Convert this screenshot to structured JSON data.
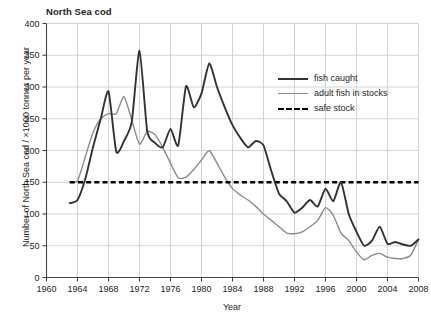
{
  "chart_data": {
    "type": "line",
    "title": "North Sea cod",
    "xlabel": "Year",
    "ylabel": "Number of North Sea cod / ×1000 tonnes per year",
    "xlim": [
      1960,
      2008
    ],
    "ylim": [
      0,
      400
    ],
    "xticks": [
      1960,
      1964,
      1968,
      1972,
      1976,
      1980,
      1984,
      1988,
      1992,
      1996,
      2000,
      2004,
      2008
    ],
    "yticks": [
      0,
      50,
      100,
      150,
      200,
      250,
      300,
      350,
      400
    ],
    "grid": true,
    "legend_position": "upper-right-inside",
    "colors": {
      "fish_caught": "#333333",
      "adult_fish_in_stocks": "#8b8b8b",
      "safe_stock": "#000000",
      "grid": "#c9c9c9",
      "axis": "#444444",
      "text": "#231f20",
      "background": "#ffffff"
    },
    "series": [
      {
        "name": "fish caught",
        "style": "solid",
        "color": "#333333",
        "x": [
          1963,
          1964,
          1965,
          1966,
          1967,
          1968,
          1969,
          1970,
          1971,
          1972,
          1973,
          1974,
          1975,
          1976,
          1977,
          1978,
          1979,
          1980,
          1981,
          1982,
          1983,
          1984,
          1985,
          1986,
          1987,
          1988,
          1989,
          1990,
          1991,
          1992,
          1993,
          1994,
          1995,
          1996,
          1997,
          1998,
          1999,
          2000,
          2001,
          2002,
          2003,
          2004,
          2005,
          2006,
          2007,
          2008
        ],
        "values": [
          117,
          122,
          155,
          205,
          250,
          293,
          198,
          215,
          245,
          357,
          230,
          212,
          205,
          234,
          208,
          301,
          268,
          290,
          337,
          300,
          268,
          240,
          220,
          205,
          215,
          208,
          168,
          132,
          120,
          102,
          110,
          122,
          112,
          140,
          120,
          150,
          100,
          72,
          50,
          58,
          80,
          53,
          56,
          52,
          50,
          60
        ]
      },
      {
        "name": "adult fish in stocks",
        "style": "solid",
        "color": "#8b8b8b",
        "x": [
          1963,
          1964,
          1965,
          1966,
          1967,
          1968,
          1969,
          1970,
          1971,
          1972,
          1973,
          1974,
          1975,
          1976,
          1977,
          1978,
          1979,
          1980,
          1981,
          1982,
          1983,
          1984,
          1985,
          1986,
          1987,
          1988,
          1989,
          1990,
          1991,
          1992,
          1993,
          1994,
          1995,
          1996,
          1997,
          1998,
          1999,
          2000,
          2001,
          2002,
          2003,
          2004,
          2005,
          2006,
          2007,
          2008
        ],
        "values": [
          150,
          152,
          190,
          228,
          250,
          258,
          258,
          285,
          248,
          210,
          230,
          225,
          205,
          180,
          157,
          158,
          170,
          185,
          200,
          180,
          158,
          140,
          130,
          122,
          112,
          100,
          90,
          80,
          70,
          69,
          72,
          80,
          90,
          110,
          98,
          70,
          58,
          40,
          28,
          35,
          38,
          32,
          30,
          30,
          35,
          60
        ]
      },
      {
        "name": "safe stock",
        "style": "dashed",
        "color": "#000000",
        "x": [
          1963,
          2008
        ],
        "values": [
          150,
          150
        ]
      }
    ],
    "legend": [
      {
        "label": "fish caught",
        "style": "solid-thick",
        "color": "#333333"
      },
      {
        "label": "adult fish in stocks",
        "style": "solid-thin",
        "color": "#8b8b8b"
      },
      {
        "label": "safe stock",
        "style": "dashed",
        "color": "#000000"
      }
    ]
  }
}
